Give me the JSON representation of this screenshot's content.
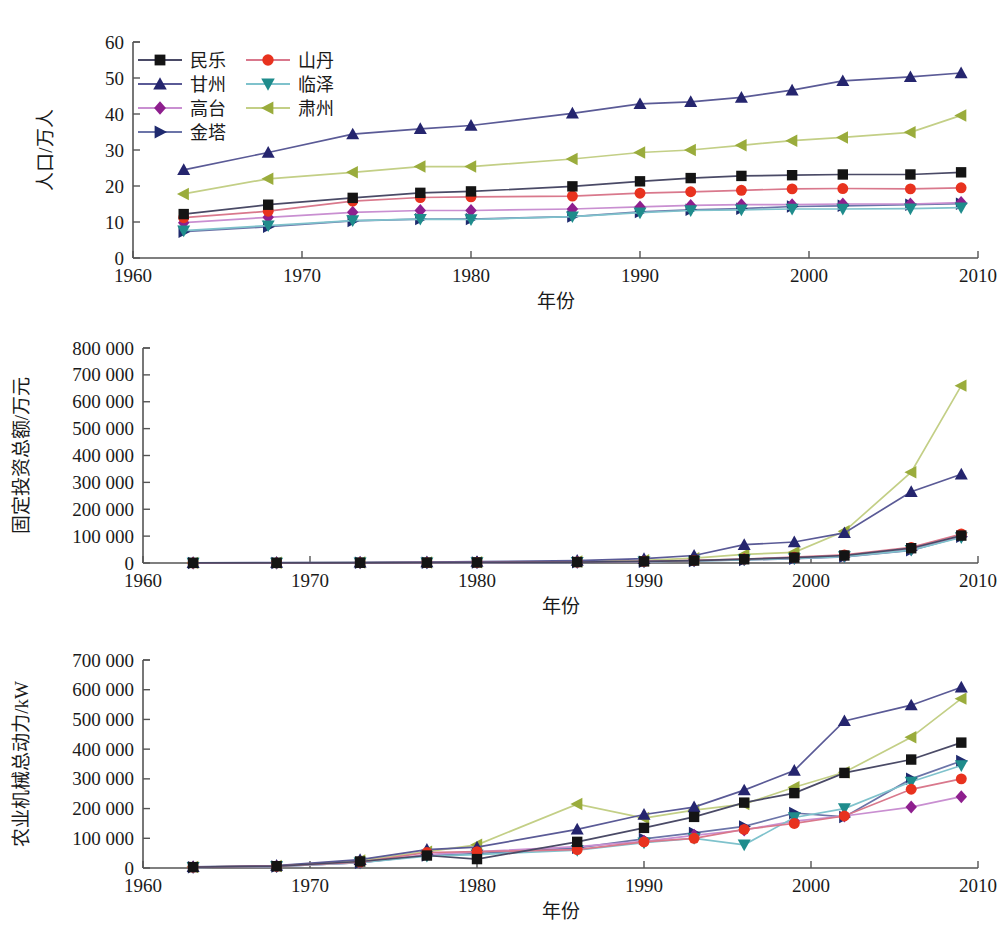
{
  "figure": {
    "background": "#ffffff",
    "panel_count": 3
  },
  "legend": {
    "position": "top-left of first panel",
    "columns": 2,
    "entries": [
      {
        "label": "民乐",
        "key": "minle",
        "marker": "square",
        "color": "#141414",
        "line_color": "#4a4a66"
      },
      {
        "label": "山丹",
        "key": "shandan",
        "marker": "circle",
        "color": "#e8321e",
        "line_color": "#d9788c"
      },
      {
        "label": "甘州",
        "key": "ganzhou",
        "marker": "triangle-up",
        "color": "#25256e",
        "line_color": "#5a5a96"
      },
      {
        "label": "临泽",
        "key": "linze",
        "marker": "triangle-down",
        "color": "#1f8c8c",
        "line_color": "#7fc2cc"
      },
      {
        "label": "高台",
        "key": "gaotai",
        "marker": "diamond",
        "color": "#8e1f8e",
        "line_color": "#c98fd1"
      },
      {
        "label": "肃州",
        "key": "suzhou",
        "marker": "triangle-left",
        "color": "#9aac3c",
        "line_color": "#c3cf86"
      },
      {
        "label": "金塔",
        "key": "jinta",
        "marker": "triangle-right",
        "color": "#1f2a6e",
        "line_color": "#6b74a8"
      }
    ]
  },
  "chart_data": [
    {
      "id": "population",
      "type": "line",
      "title": "",
      "xlabel": "年份",
      "ylabel": "人口/万人",
      "xlim": [
        1960,
        2010
      ],
      "ylim": [
        0,
        60
      ],
      "xticks": [
        1960,
        1970,
        1980,
        1990,
        2000,
        2010
      ],
      "xtick_labels": [
        "1960",
        "1970",
        "1980",
        "1990",
        "2000",
        "2010"
      ],
      "yticks": [
        0,
        10,
        20,
        30,
        40,
        50,
        60
      ],
      "ytick_labels": [
        "0",
        "10",
        "20",
        "30",
        "40",
        "50",
        "60"
      ],
      "grid": false,
      "x": [
        1963,
        1968,
        1973,
        1977,
        1980,
        1986,
        1990,
        1993,
        1996,
        1999,
        2002,
        2006,
        2009
      ],
      "series": [
        {
          "name": "民乐",
          "key": "minle",
          "values": [
            12.2,
            14.8,
            16.7,
            18.1,
            18.5,
            19.9,
            21.3,
            22.2,
            22.8,
            23.0,
            23.2,
            23.2,
            23.8
          ]
        },
        {
          "name": "山丹",
          "key": "shandan",
          "values": [
            11.2,
            13.0,
            15.8,
            16.8,
            17.0,
            17.2,
            18.0,
            18.4,
            18.8,
            19.2,
            19.3,
            19.2,
            19.5
          ]
        },
        {
          "name": "甘州",
          "key": "ganzhou",
          "values": [
            24.5,
            29.3,
            34.4,
            35.9,
            36.8,
            40.2,
            42.8,
            43.4,
            44.6,
            46.6,
            49.2,
            50.3,
            51.4
          ]
        },
        {
          "name": "临泽",
          "key": "linze",
          "values": [
            7.6,
            9.0,
            10.4,
            10.8,
            10.7,
            11.5,
            12.6,
            13.2,
            13.4,
            13.6,
            13.6,
            13.7,
            14.0
          ]
        },
        {
          "name": "高台",
          "key": "gaotai",
          "values": [
            9.8,
            11.3,
            12.7,
            13.2,
            13.2,
            13.6,
            14.2,
            14.6,
            14.8,
            14.8,
            15.0,
            15.0,
            15.4
          ]
        },
        {
          "name": "肃州",
          "key": "suzhou",
          "values": [
            17.8,
            22.0,
            23.8,
            25.4,
            25.4,
            27.5,
            29.3,
            30.0,
            31.3,
            32.6,
            33.5,
            34.9,
            39.6
          ]
        },
        {
          "name": "金塔",
          "key": "jinta",
          "values": [
            7.3,
            8.7,
            10.3,
            10.8,
            10.8,
            11.5,
            12.8,
            13.4,
            13.7,
            14.3,
            14.5,
            14.8,
            15.1
          ]
        }
      ]
    },
    {
      "id": "fixed-investment",
      "type": "line",
      "title": "",
      "xlabel": "年份",
      "ylabel": "固定投资总额/万元",
      "xlim": [
        1960,
        2010
      ],
      "ylim": [
        0,
        800000
      ],
      "xticks": [
        1960,
        1970,
        1980,
        1990,
        2000,
        2010
      ],
      "xtick_labels": [
        "1960",
        "1970",
        "1980",
        "1990",
        "2000",
        "2010"
      ],
      "yticks": [
        0,
        100000,
        200000,
        300000,
        400000,
        500000,
        600000,
        700000,
        800000
      ],
      "ytick_labels": [
        "0",
        "100 000",
        "200 000",
        "300 000",
        "400 000",
        "500 000",
        "600 000",
        "700 000",
        "800 000"
      ],
      "grid": false,
      "x": [
        1963,
        1968,
        1973,
        1977,
        1980,
        1986,
        1990,
        1993,
        1996,
        1999,
        2002,
        2006,
        2009
      ],
      "series": [
        {
          "name": "民乐",
          "key": "minle",
          "values": [
            300,
            500,
            900,
            1400,
            2000,
            3500,
            6000,
            9000,
            14000,
            20000,
            28000,
            55000,
            102000
          ]
        },
        {
          "name": "山丹",
          "key": "shandan",
          "values": [
            300,
            500,
            900,
            1400,
            2000,
            3600,
            6200,
            9500,
            15000,
            22000,
            30000,
            58000,
            108000
          ]
        },
        {
          "name": "甘州",
          "key": "ganzhou",
          "values": [
            900,
            1500,
            2500,
            3500,
            5000,
            9000,
            16000,
            28000,
            68000,
            78000,
            112000,
            265000,
            330000
          ]
        },
        {
          "name": "临泽",
          "key": "linze",
          "values": [
            200,
            400,
            700,
            1100,
            1600,
            2800,
            5000,
            8000,
            12000,
            17000,
            24000,
            48000,
            95000
          ]
        },
        {
          "name": "高台",
          "key": "gaotai",
          "values": [
            200,
            400,
            700,
            1200,
            1700,
            3000,
            5200,
            8500,
            13000,
            18000,
            25000,
            50000,
            100000
          ]
        },
        {
          "name": "肃州",
          "key": "suzhou",
          "values": [
            500,
            900,
            1500,
            2200,
            3000,
            5500,
            10000,
            18000,
            32000,
            40000,
            118000,
            338000,
            660000
          ]
        },
        {
          "name": "金塔",
          "key": "jinta",
          "values": [
            200,
            400,
            700,
            1100,
            1500,
            2700,
            4800,
            7500,
            11000,
            16000,
            23000,
            47000,
            98000
          ]
        }
      ]
    },
    {
      "id": "agricultural-machinery-power",
      "type": "line",
      "title": "",
      "xlabel": "年份",
      "ylabel": "农业机械总动力/kW",
      "xlim": [
        1960,
        2010
      ],
      "ylim": [
        0,
        700000
      ],
      "xticks": [
        1960,
        1970,
        1980,
        1990,
        2000,
        2010
      ],
      "xtick_labels": [
        "1960",
        "1970",
        "1980",
        "1990",
        "2000",
        "2010"
      ],
      "yticks": [
        0,
        100000,
        200000,
        300000,
        400000,
        500000,
        600000,
        700000
      ],
      "ytick_labels": [
        "0",
        "100 000",
        "200 000",
        "300 000",
        "400 000",
        "500 000",
        "600 000",
        "700 000"
      ],
      "grid": false,
      "x": [
        1963,
        1968,
        1973,
        1977,
        1980,
        1986,
        1990,
        1993,
        1996,
        1999,
        2002,
        2006,
        2009
      ],
      "series": [
        {
          "name": "民乐",
          "key": "minle",
          "values": [
            3000,
            6000,
            22000,
            42000,
            30000,
            88000,
            135000,
            172000,
            220000,
            252000,
            320000,
            365000,
            422000
          ]
        },
        {
          "name": "山丹",
          "key": "shandan",
          "values": [
            3000,
            6000,
            20000,
            52000,
            55000,
            62000,
            88000,
            100000,
            130000,
            150000,
            175000,
            265000,
            300000
          ]
        },
        {
          "name": "甘州",
          "key": "ganzhou",
          "values": [
            4000,
            8000,
            28000,
            62000,
            70000,
            130000,
            180000,
            205000,
            262000,
            328000,
            495000,
            548000,
            608000
          ]
        },
        {
          "name": "临泽",
          "key": "linze",
          "values": [
            2500,
            5000,
            18000,
            40000,
            45000,
            60000,
            85000,
            100000,
            78000,
            170000,
            200000,
            290000,
            345000
          ]
        },
        {
          "name": "高台",
          "key": "gaotai",
          "values": [
            2500,
            5000,
            18000,
            45000,
            55000,
            72000,
            90000,
            110000,
            128000,
            158000,
            175000,
            205000,
            240000
          ]
        },
        {
          "name": "肃州",
          "key": "suzhou",
          "values": [
            3500,
            7000,
            25000,
            55000,
            78000,
            215000,
            168000,
            195000,
            215000,
            272000,
            322000,
            440000,
            570000
          ]
        },
        {
          "name": "金塔",
          "key": "jinta",
          "values": [
            2500,
            5000,
            18000,
            42000,
            48000,
            68000,
            98000,
            118000,
            140000,
            185000,
            172000,
            300000,
            360000
          ]
        }
      ]
    }
  ]
}
